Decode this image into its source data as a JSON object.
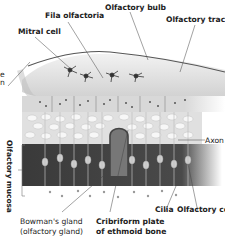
{
  "labels": {
    "fila_olfactoria": "Fila olfactoria",
    "olfactory_bulb": "Olfactory bulb",
    "olfactory_tract": "Olfactory tract",
    "mitral_cell": "Mitral cell",
    "cut_left_1": "e",
    "cut_left_2": "n",
    "axon": "Axon",
    "olfactory_mucosa": "Olfactory mucosa",
    "cilia": "Cilia",
    "olfactory_cell": "Olfactory cell",
    "bowmans_gland_1": "Bowman's gland",
    "bowmans_gland_2": "(olfactory gland)",
    "cribriform_1": "Cribriform plate",
    "cribriform_2": "of ethmoid bone"
  }
}
